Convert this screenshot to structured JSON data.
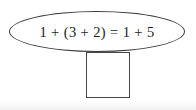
{
  "diagram": {
    "equation": "1 + (3 + 2) = 1 + 5",
    "shapes": {
      "ellipse": "equation-ellipse",
      "square": "blank-square"
    },
    "colors": {
      "stroke": "#3a3a3a",
      "text": "#1c1c1c",
      "background": "#ffffff"
    }
  }
}
